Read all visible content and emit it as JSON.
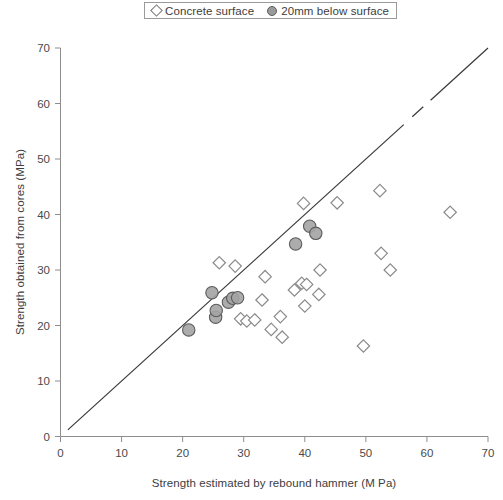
{
  "legend": {
    "position": "top-center",
    "items": [
      {
        "label": "Concrete surface",
        "marker": "open-diamond"
      },
      {
        "label": "20mm below surface",
        "marker": "filled-circle"
      }
    ]
  },
  "chart_data": {
    "type": "scatter",
    "title": "",
    "xlabel": "Strength estimated by rebound hammer (M Pa)",
    "ylabel": "Strength obtained from cores (MPa)",
    "xlim": [
      0,
      70
    ],
    "ylim": [
      0,
      70
    ],
    "xticks": [
      0,
      10,
      20,
      30,
      40,
      50,
      60,
      70
    ],
    "yticks": [
      0,
      10,
      20,
      30,
      40,
      50,
      60,
      70
    ],
    "grid": false,
    "legend_position": "top-center",
    "annotations": [
      {
        "type": "line",
        "name": "line-of-equality",
        "x": [
          0,
          70
        ],
        "y": [
          0,
          70
        ],
        "style": "solid-with-breaks"
      }
    ],
    "series": [
      {
        "name": "Concrete surface",
        "marker": "open-diamond",
        "color": "#ffffff",
        "edge_color": "#8a8a8a",
        "points": [
          {
            "x": 26.0,
            "y": 31.3
          },
          {
            "x": 28.6,
            "y": 30.7
          },
          {
            "x": 29.5,
            "y": 21.2
          },
          {
            "x": 30.5,
            "y": 20.8
          },
          {
            "x": 31.8,
            "y": 21.0
          },
          {
            "x": 33.5,
            "y": 28.8
          },
          {
            "x": 33.0,
            "y": 24.6
          },
          {
            "x": 34.5,
            "y": 19.3
          },
          {
            "x": 36.0,
            "y": 21.6
          },
          {
            "x": 36.3,
            "y": 17.9
          },
          {
            "x": 38.3,
            "y": 26.4
          },
          {
            "x": 39.5,
            "y": 27.6
          },
          {
            "x": 40.3,
            "y": 27.4
          },
          {
            "x": 39.8,
            "y": 42.0
          },
          {
            "x": 40.0,
            "y": 23.5
          },
          {
            "x": 42.5,
            "y": 30.0
          },
          {
            "x": 42.3,
            "y": 25.6
          },
          {
            "x": 45.3,
            "y": 42.1
          },
          {
            "x": 49.6,
            "y": 16.3
          },
          {
            "x": 52.3,
            "y": 44.3
          },
          {
            "x": 52.5,
            "y": 33.0
          },
          {
            "x": 54.0,
            "y": 30.0
          },
          {
            "x": 63.8,
            "y": 40.4
          }
        ]
      },
      {
        "name": "20mm below surface",
        "marker": "filled-circle",
        "color": "#a3a3a3",
        "edge_color": "#5c5c5c",
        "points": [
          {
            "x": 21.0,
            "y": 19.2
          },
          {
            "x": 24.8,
            "y": 25.9
          },
          {
            "x": 25.4,
            "y": 21.5
          },
          {
            "x": 25.5,
            "y": 22.7
          },
          {
            "x": 27.5,
            "y": 24.2
          },
          {
            "x": 28.2,
            "y": 24.9
          },
          {
            "x": 29.0,
            "y": 25.0
          },
          {
            "x": 38.5,
            "y": 34.7
          },
          {
            "x": 40.8,
            "y": 37.9
          },
          {
            "x": 41.8,
            "y": 36.6
          }
        ]
      }
    ]
  }
}
